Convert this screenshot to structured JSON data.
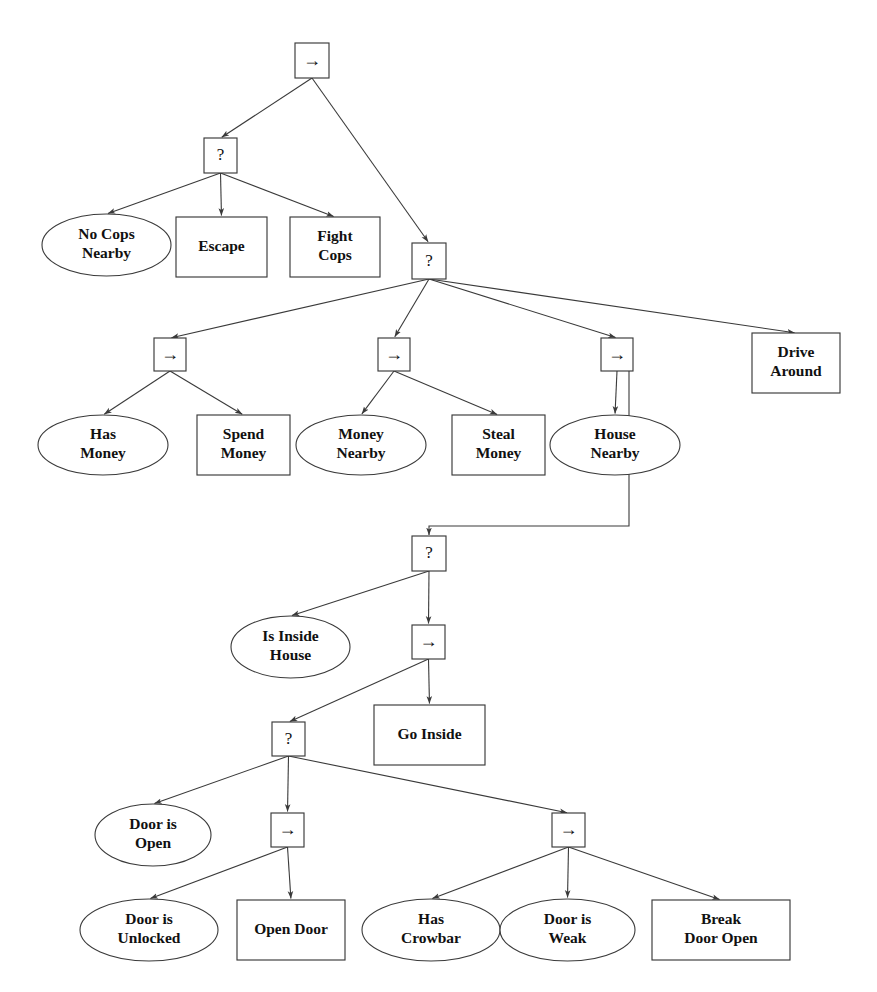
{
  "diagram": {
    "type": "behavior-tree",
    "title": "",
    "canvas": {
      "width": 877,
      "height": 992
    },
    "background_color": "#ffffff",
    "stroke_color": "#3a3a3a",
    "text_color": "#111111",
    "symbols": {
      "sequence": "→",
      "fallback": "?"
    },
    "legend": {
      "sequence_meaning": "Sequence node",
      "fallback_meaning": "Fallback / selector node",
      "box_meaning": "Action node",
      "ellipse_meaning": "Condition node"
    },
    "nodes": [
      {
        "id": "n1",
        "kind": "sequence",
        "label": "→",
        "shape": "box",
        "x": 295,
        "y": 43,
        "w": 34,
        "h": 35
      },
      {
        "id": "n2",
        "kind": "fallback",
        "label": "?",
        "shape": "box",
        "x": 204,
        "y": 138,
        "w": 33,
        "h": 35
      },
      {
        "id": "n3",
        "kind": "condition",
        "label": "No Cops\nNearby",
        "shape": "ellipse",
        "x": 42,
        "y": 214,
        "w": 129,
        "h": 62
      },
      {
        "id": "n4",
        "kind": "action",
        "label": "Escape",
        "shape": "box",
        "x": 176,
        "y": 217,
        "w": 91,
        "h": 60
      },
      {
        "id": "n5",
        "kind": "action",
        "label": "Fight\nCops",
        "shape": "box",
        "x": 290,
        "y": 217,
        "w": 90,
        "h": 60
      },
      {
        "id": "n6",
        "kind": "fallback",
        "label": "?",
        "shape": "box",
        "x": 412,
        "y": 243,
        "w": 34,
        "h": 36
      },
      {
        "id": "n7",
        "kind": "sequence",
        "label": "→",
        "shape": "box",
        "x": 154,
        "y": 338,
        "w": 32,
        "h": 33
      },
      {
        "id": "n8",
        "kind": "sequence",
        "label": "→",
        "shape": "box",
        "x": 378,
        "y": 338,
        "w": 32,
        "h": 33
      },
      {
        "id": "n9",
        "kind": "sequence",
        "label": "→",
        "shape": "box",
        "x": 601,
        "y": 338,
        "w": 32,
        "h": 33
      },
      {
        "id": "n10",
        "kind": "action",
        "label": "Drive\nAround",
        "shape": "box",
        "x": 752,
        "y": 333,
        "w": 88,
        "h": 60
      },
      {
        "id": "n11",
        "kind": "condition",
        "label": "Has\nMoney",
        "shape": "ellipse",
        "x": 38,
        "y": 415,
        "w": 130,
        "h": 60
      },
      {
        "id": "n12",
        "kind": "action",
        "label": "Spend\nMoney",
        "shape": "box",
        "x": 197,
        "y": 415,
        "w": 93,
        "h": 60
      },
      {
        "id": "n13",
        "kind": "condition",
        "label": "Money\nNearby",
        "shape": "ellipse",
        "x": 296,
        "y": 415,
        "w": 130,
        "h": 60
      },
      {
        "id": "n14",
        "kind": "action",
        "label": "Steal\nMoney",
        "shape": "box",
        "x": 452,
        "y": 415,
        "w": 93,
        "h": 60
      },
      {
        "id": "n15",
        "kind": "condition",
        "label": "House\nNearby",
        "shape": "ellipse",
        "x": 550,
        "y": 415,
        "w": 130,
        "h": 60
      },
      {
        "id": "n16",
        "kind": "fallback",
        "label": "?",
        "shape": "box",
        "x": 412,
        "y": 536,
        "w": 34,
        "h": 35
      },
      {
        "id": "n17",
        "kind": "condition",
        "label": "Is Inside\nHouse",
        "shape": "ellipse",
        "x": 231,
        "y": 616,
        "w": 119,
        "h": 62
      },
      {
        "id": "n18",
        "kind": "sequence",
        "label": "→",
        "shape": "box",
        "x": 412,
        "y": 625,
        "w": 33,
        "h": 34
      },
      {
        "id": "n19",
        "kind": "fallback",
        "label": "?",
        "shape": "box",
        "x": 272,
        "y": 722,
        "w": 33,
        "h": 34
      },
      {
        "id": "n20",
        "kind": "action",
        "label": "Go Inside",
        "shape": "box",
        "x": 374,
        "y": 705,
        "w": 111,
        "h": 60
      },
      {
        "id": "n21",
        "kind": "condition",
        "label": "Door is\nOpen",
        "shape": "ellipse",
        "x": 95,
        "y": 804,
        "w": 116,
        "h": 62
      },
      {
        "id": "n22",
        "kind": "sequence",
        "label": "→",
        "shape": "box",
        "x": 271,
        "y": 813,
        "w": 33,
        "h": 34
      },
      {
        "id": "n23",
        "kind": "sequence",
        "label": "→",
        "shape": "box",
        "x": 552,
        "y": 813,
        "w": 33,
        "h": 34
      },
      {
        "id": "n24",
        "kind": "condition",
        "label": "Door is\nUnlocked",
        "shape": "ellipse",
        "x": 80,
        "y": 899,
        "w": 138,
        "h": 62
      },
      {
        "id": "n25",
        "kind": "action",
        "label": "Open Door",
        "shape": "box",
        "x": 237,
        "y": 900,
        "w": 108,
        "h": 60
      },
      {
        "id": "n26",
        "kind": "condition",
        "label": "Has\nCrowbar",
        "shape": "ellipse",
        "x": 362,
        "y": 899,
        "w": 138,
        "h": 62
      },
      {
        "id": "n27",
        "kind": "condition",
        "label": "Door is\nWeak",
        "shape": "ellipse",
        "x": 500,
        "y": 899,
        "w": 135,
        "h": 62
      },
      {
        "id": "n28",
        "kind": "action",
        "label": "Break\nDoor Open",
        "shape": "box",
        "x": 652,
        "y": 900,
        "w": 138,
        "h": 60
      }
    ],
    "edges": [
      {
        "from": "n1",
        "to": "n2"
      },
      {
        "from": "n1",
        "to": "n6"
      },
      {
        "from": "n2",
        "to": "n3"
      },
      {
        "from": "n2",
        "to": "n4"
      },
      {
        "from": "n2",
        "to": "n5"
      },
      {
        "from": "n6",
        "to": "n7"
      },
      {
        "from": "n6",
        "to": "n8"
      },
      {
        "from": "n6",
        "to": "n9"
      },
      {
        "from": "n6",
        "to": "n10"
      },
      {
        "from": "n7",
        "to": "n11"
      },
      {
        "from": "n7",
        "to": "n12"
      },
      {
        "from": "n8",
        "to": "n13"
      },
      {
        "from": "n8",
        "to": "n14"
      },
      {
        "from": "n9",
        "to": "n15"
      },
      {
        "from": "n9",
        "to": "n16",
        "routing": "orthogonal"
      },
      {
        "from": "n16",
        "to": "n17"
      },
      {
        "from": "n16",
        "to": "n18"
      },
      {
        "from": "n18",
        "to": "n19"
      },
      {
        "from": "n18",
        "to": "n20"
      },
      {
        "from": "n19",
        "to": "n21"
      },
      {
        "from": "n19",
        "to": "n22"
      },
      {
        "from": "n19",
        "to": "n23"
      },
      {
        "from": "n22",
        "to": "n24"
      },
      {
        "from": "n22",
        "to": "n25"
      },
      {
        "from": "n23",
        "to": "n26"
      },
      {
        "from": "n23",
        "to": "n27"
      },
      {
        "from": "n23",
        "to": "n28"
      }
    ]
  }
}
